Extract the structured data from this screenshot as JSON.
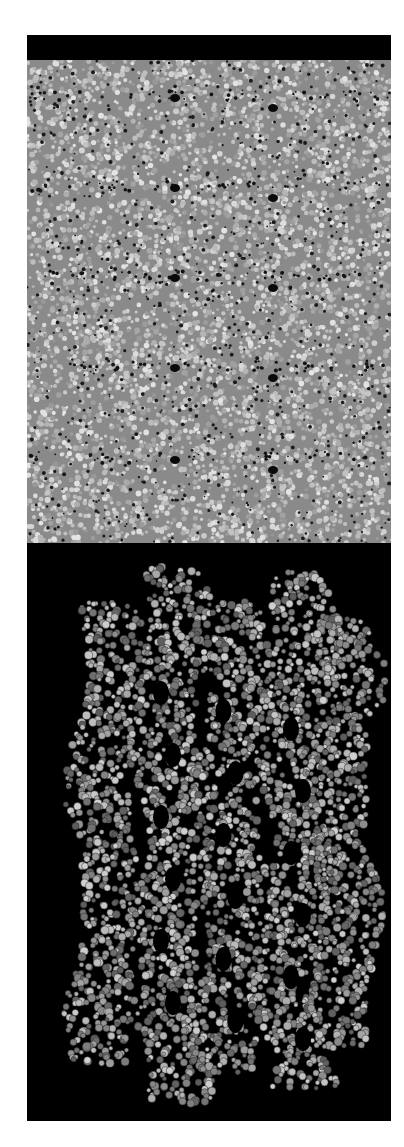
{
  "figure": {
    "panels": [
      {
        "id": "top",
        "description": "Packed molecular surface (space-filling view), gray atoms with periodic dark bands",
        "background": "#000000",
        "atom_color": "#b8b8b8",
        "band_rows": 5
      },
      {
        "id": "bottom",
        "description": "Side view of staggered helical molecular columns (space-filling), black background",
        "background": "#000000",
        "atom_color": "#a9a9a9",
        "column_count": 4
      }
    ]
  }
}
